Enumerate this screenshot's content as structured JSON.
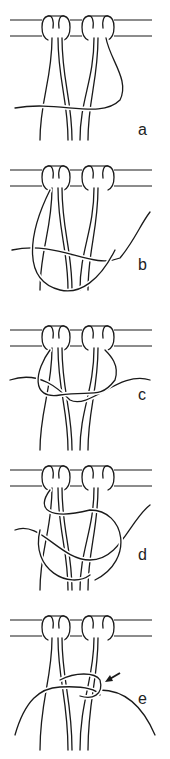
{
  "figure": {
    "panels": [
      {
        "label": "a"
      },
      {
        "label": "b"
      },
      {
        "label": "c"
      },
      {
        "label": "d"
      },
      {
        "label": "e",
        "annotation": "arrow-pointing-to-knot"
      }
    ]
  },
  "colors": {
    "line": "#1a1a1a",
    "background": "#ffffff"
  }
}
